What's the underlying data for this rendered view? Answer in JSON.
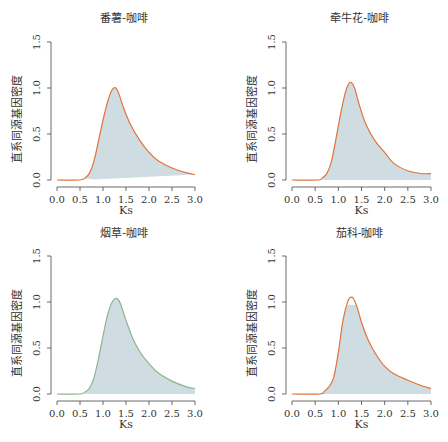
{
  "chart_data": [
    {
      "type": "area",
      "title": "番薯-咖啡",
      "xlabel": "Ks",
      "ylabel": "直系同源基因密度",
      "xlim": [
        0.0,
        3.0
      ],
      "ylim": [
        0.0,
        1.5
      ],
      "xticks": [
        "0.0",
        "0.5",
        "1.0",
        "1.5",
        "2.0",
        "2.5",
        "3.0"
      ],
      "yticks": [
        "0.0",
        "0.5",
        "1.0",
        "1.5"
      ],
      "line_color": "#e0733a",
      "fill_color": "#cfdde3",
      "fill_closes_diagonally": true,
      "x": [
        0.0,
        0.5,
        0.6,
        0.7,
        0.8,
        0.9,
        1.0,
        1.1,
        1.2,
        1.28,
        1.35,
        1.45,
        1.6,
        1.8,
        2.0,
        2.2,
        2.5,
        2.8,
        3.0
      ],
      "y": [
        0.0,
        0.0,
        0.02,
        0.07,
        0.2,
        0.42,
        0.65,
        0.85,
        0.98,
        1.0,
        0.93,
        0.78,
        0.6,
        0.43,
        0.3,
        0.21,
        0.13,
        0.08,
        0.06
      ]
    },
    {
      "type": "area",
      "title": "牵牛花-咖啡",
      "xlabel": "Ks",
      "ylabel": "直系同源基因密度",
      "xlim": [
        0.0,
        3.0
      ],
      "ylim": [
        0.0,
        1.5
      ],
      "xticks": [
        "0.0",
        "0.5",
        "1.0",
        "1.5",
        "2.0",
        "2.5",
        "3.0"
      ],
      "yticks": [
        "0.0",
        "0.5",
        "1.0",
        "1.5"
      ],
      "line_color": "#e0733a",
      "fill_color": "#cfdde3",
      "fill_closes_diagonally": false,
      "x": [
        0.0,
        0.55,
        0.65,
        0.75,
        0.85,
        0.95,
        1.05,
        1.15,
        1.22,
        1.28,
        1.35,
        1.45,
        1.6,
        1.8,
        2.0,
        2.2,
        2.5,
        2.8,
        3.0
      ],
      "y": [
        0.0,
        0.0,
        0.02,
        0.07,
        0.2,
        0.45,
        0.72,
        0.95,
        1.04,
        1.06,
        1.0,
        0.82,
        0.6,
        0.42,
        0.3,
        0.18,
        0.1,
        0.07,
        0.07
      ]
    },
    {
      "type": "area",
      "title": "烟草-咖啡",
      "xlabel": "Ks",
      "ylabel": "直系同源基因密度",
      "xlim": [
        0.0,
        3.0
      ],
      "ylim": [
        0.0,
        1.5
      ],
      "xticks": [
        "0.0",
        "0.5",
        "1.0",
        "1.5",
        "2.0",
        "2.5",
        "3.0"
      ],
      "yticks": [
        "0.0",
        "0.5",
        "1.0",
        "1.5"
      ],
      "line_color": "#8fb48a",
      "fill_color": "#cfdde3",
      "fill_closes_diagonally": false,
      "x": [
        0.0,
        0.5,
        0.6,
        0.7,
        0.8,
        0.9,
        1.0,
        1.1,
        1.2,
        1.3,
        1.38,
        1.5,
        1.65,
        1.8,
        2.0,
        2.2,
        2.5,
        2.8,
        3.0
      ],
      "y": [
        0.0,
        0.0,
        0.02,
        0.06,
        0.17,
        0.38,
        0.63,
        0.86,
        1.0,
        1.04,
        0.98,
        0.8,
        0.6,
        0.46,
        0.33,
        0.23,
        0.14,
        0.08,
        0.06
      ]
    },
    {
      "type": "area",
      "title": "茄科-咖啡",
      "xlabel": "Ks",
      "ylabel": "直系同源基因密度",
      "xlim": [
        0.0,
        3.0
      ],
      "ylim": [
        0.0,
        1.5
      ],
      "xticks": [
        "0.0",
        "0.5",
        "1.0",
        "1.5",
        "2.0",
        "2.5",
        "3.0"
      ],
      "yticks": [
        "0.0",
        "0.5",
        "1.0",
        "1.5"
      ],
      "line_color": "#e0733a",
      "fill_color": "#cfdde3",
      "fill_closes_diagonally": false,
      "fill_peak": 0.97,
      "x": [
        0.0,
        0.6,
        0.7,
        0.8,
        0.9,
        1.0,
        1.1,
        1.2,
        1.26,
        1.32,
        1.4,
        1.5,
        1.65,
        1.8,
        2.0,
        2.2,
        2.5,
        2.8,
        3.0
      ],
      "y": [
        0.0,
        0.0,
        0.03,
        0.08,
        0.18,
        0.45,
        0.8,
        1.0,
        1.05,
        1.04,
        0.95,
        0.78,
        0.58,
        0.44,
        0.3,
        0.22,
        0.15,
        0.09,
        0.06
      ]
    }
  ]
}
